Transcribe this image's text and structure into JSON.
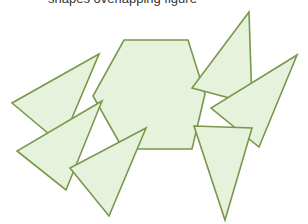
{
  "caption": {
    "text": "shapes overlapping figure"
  },
  "style": {
    "fill": "#e6f2dc",
    "stroke": "#78984c"
  },
  "shapes": [
    {
      "name": "hexagon",
      "points": "124,40 188,40 205,94 192,149 123,149 93,96"
    },
    {
      "name": "triangle-top-right",
      "points": "249,12 192,88 252,104"
    },
    {
      "name": "triangle-right",
      "points": "297,55 211,108 259,147"
    },
    {
      "name": "triangle-bottom-right",
      "points": "194,126 252,128 225,220"
    },
    {
      "name": "triangle-left",
      "points": "99,54 12,103 61,144"
    },
    {
      "name": "triangle-middle-left",
      "points": "102,101 17,151 66,190"
    },
    {
      "name": "triangle-bottom-left",
      "points": "146,128 70,168 109,216"
    }
  ]
}
